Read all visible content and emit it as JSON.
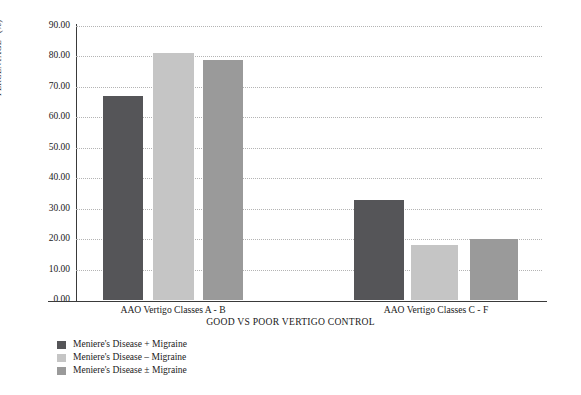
{
  "chart_data": {
    "type": "bar",
    "title": "",
    "subtitle": "",
    "xlabel": "GOOD VS POOR VERTIGO CONTROL",
    "ylabel": "PERCENTAGE* (%)",
    "categories": [
      "AAO Vertigo Classes A - B",
      "AAO Vertigo Classes C - F"
    ],
    "series": [
      {
        "name": "Meniere's Disease + Migraine",
        "color": "#555558",
        "values": [
          67.0,
          33.0
        ]
      },
      {
        "name": "Meniere's Disease – Migraine",
        "color": "#c5c5c5",
        "values": [
          81.0,
          18.0
        ]
      },
      {
        "name": "Meniere's Disease ± Migraine",
        "color": "#9a9a9a",
        "values": [
          79.0,
          20.0
        ]
      }
    ],
    "ylim": [
      0,
      90
    ],
    "ytick_step": 10,
    "ytick_labels": [
      "0.00",
      "10.00",
      "20.00",
      "30.00",
      "40.00",
      "50.00",
      "60.00",
      "70.00",
      "80.00",
      "90.00"
    ],
    "ytick_values": [
      0,
      10,
      20,
      30,
      40,
      50,
      60,
      70,
      80,
      90
    ],
    "grid": true,
    "grid_style": "dotted",
    "grid_color": "#b4b4b4",
    "legend_position": "bottom-left",
    "background": "#ffffff",
    "axis_color": "#3a3a3a"
  },
  "axes": {
    "y_title": "PERCENTAGE* (%)",
    "x_title": "GOOD VS POOR VERTIGO CONTROL"
  },
  "legend": {
    "items": [
      {
        "label": "Meniere's Disease + Migraine",
        "color": "#555558"
      },
      {
        "label": "Meniere's Disease – Migraine",
        "color": "#c5c5c5"
      },
      {
        "label": "Meniere's Disease ± Migraine",
        "color": "#9a9a9a"
      }
    ]
  }
}
